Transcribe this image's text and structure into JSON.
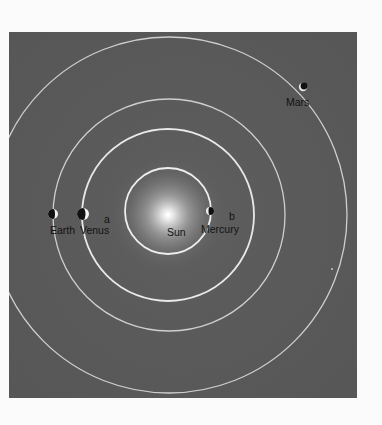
{
  "diagram": {
    "type": "solar-system-orbits",
    "colors": {
      "background": "#5a5a5a",
      "orbit": "#d8d8d8",
      "orbit_inner_bright": "#f0f0f0",
      "label": "#121212",
      "sun_glow": "#ffffff"
    },
    "sun": {
      "label": "Sun",
      "cx": 159,
      "cy": 183
    },
    "orbits": [
      {
        "name": "Mercury",
        "r": 43
      },
      {
        "name": "Venus",
        "r": 86
      },
      {
        "name": "Earth",
        "r": 116
      },
      {
        "name": "Mars",
        "r": 178
      }
    ],
    "planets": [
      {
        "name": "Mercury",
        "label": "Mercury",
        "cx": 201,
        "cy": 179,
        "r": 4,
        "lit_side": "left"
      },
      {
        "name": "Venus",
        "label": "Venus",
        "cx": 74,
        "cy": 182,
        "r": 6,
        "lit_side": "right"
      },
      {
        "name": "Earth",
        "label": "Earth",
        "cx": 44,
        "cy": 182,
        "r": 5,
        "lit_side": "right"
      },
      {
        "name": "Mars",
        "label": "Mars",
        "cx": 294,
        "cy": 55,
        "r": 4,
        "lit_side": "lower-left"
      }
    ],
    "markers": [
      {
        "label": "a"
      },
      {
        "label": "b"
      }
    ]
  }
}
